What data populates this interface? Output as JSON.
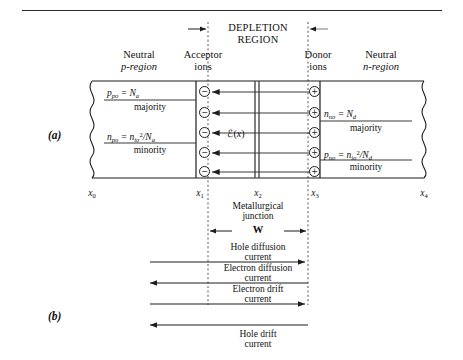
{
  "figure": {
    "panel_a_label": "(a)",
    "panel_b_label": "(b)"
  },
  "headings": {
    "depletion_line1": "DEPLETION",
    "depletion_line2": "REGION",
    "neutral_p_line1": "Neutral",
    "neutral_p_line2": "p-region",
    "acceptor_line1": "Acceptor",
    "acceptor_line2": "ions",
    "donor_line1": "Donor",
    "donor_line2": "ions",
    "neutral_n_line1": "Neutral",
    "neutral_n_line2": "n-region"
  },
  "p_region": {
    "majority_symbol": "p",
    "majority_sub": "po",
    "majority_equals": "= N",
    "majority_equals_sub": "a",
    "majority_label": "majority",
    "minority_symbol": "n",
    "minority_sub": "po",
    "minority_equals": "= n",
    "minority_num_sub": "io",
    "minority_num_sup": "2",
    "minority_den": "/N",
    "minority_den_sub": "a",
    "minority_label": "minority"
  },
  "n_region": {
    "majority_symbol": "n",
    "majority_sub": "no",
    "majority_equals": "= N",
    "majority_equals_sub": "d",
    "majority_label": "majority",
    "minority_symbol": "p",
    "minority_sub": "no",
    "minority_equals": "= n",
    "minority_num_sub": "io",
    "minority_num_sup": "2",
    "minority_den": "/N",
    "minority_den_sub": "d",
    "minority_label": "minority"
  },
  "field": {
    "label_symbol": "ℰ(",
    "label_var": "x",
    "label_close": ")"
  },
  "axis": {
    "ticks": [
      {
        "name": "x",
        "sub": "0"
      },
      {
        "name": "x",
        "sub": "1"
      },
      {
        "name": "x",
        "sub": "2"
      },
      {
        "name": "x",
        "sub": "3"
      },
      {
        "name": "x",
        "sub": "4"
      }
    ]
  },
  "junction": {
    "line1": "Metallurgical",
    "line2": "junction",
    "width_label": "W"
  },
  "currents": [
    {
      "line1": "Hole diffusion",
      "line2": "current",
      "direction": "right"
    },
    {
      "line1": "Electron diffusion",
      "line2": "current",
      "direction": "left"
    },
    {
      "line1": "Electron drift",
      "line2": "current",
      "direction": "right"
    },
    {
      "line1": "Hole drift",
      "line2": "current",
      "direction": "left"
    }
  ],
  "ions": {
    "acceptor_glyph": "−",
    "donor_glyph": "+",
    "acceptor_count": 5,
    "donor_count": 5
  },
  "colors": {
    "ink": "#1d1d1d",
    "rule": "#2a2a2a",
    "dash": "#555555"
  }
}
